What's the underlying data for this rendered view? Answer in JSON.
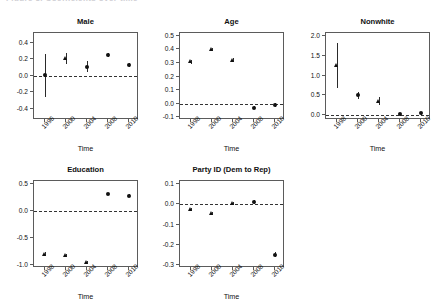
{
  "figure": {
    "clipped_header_text": "Figure 3. Coefficients over time",
    "background_color": "#ffffff",
    "marker_color": "#111111",
    "axis_color": "#5b5b5b",
    "zero_line_color": "#333333"
  },
  "chart_data": [
    {
      "type": "scatter",
      "title": "Male",
      "xlabel": "Time",
      "ylabel": "",
      "grid": false,
      "legend": "none",
      "zero_reference_line": 0.0,
      "x": [
        1996,
        2000,
        2004,
        2008,
        2010
      ],
      "xticklabels": [
        "1996",
        "2000",
        "2004",
        "2008",
        "2010"
      ],
      "values": [
        0.01,
        0.21,
        0.11,
        0.25,
        0.13
      ],
      "ci_low": [
        -0.26,
        0.14,
        0.05,
        0.225,
        0.1
      ],
      "ci_high": [
        0.27,
        0.28,
        0.18,
        0.275,
        0.16
      ],
      "marker_shapes": [
        "dot",
        "tri",
        "dot",
        "dot",
        "dot"
      ],
      "ylim": [
        -0.54,
        0.52
      ],
      "yticks": [
        0.4,
        0.2,
        0.0,
        -0.2,
        -0.4
      ],
      "yticklabels": [
        "0.4",
        "0.2",
        "0.0",
        "-0.2",
        "-0.4"
      ]
    },
    {
      "type": "scatter",
      "title": "Age",
      "xlabel": "Time",
      "ylabel": "",
      "grid": false,
      "legend": "none",
      "zero_reference_line": 0.0,
      "x": [
        1998,
        2000,
        2004,
        2008,
        2010
      ],
      "xticklabels": [
        "1998",
        "2000",
        "2004",
        "2008",
        "2010"
      ],
      "values": [
        0.31,
        0.4,
        0.32,
        -0.03,
        -0.01
      ],
      "ci_low": [
        0.295,
        0.39,
        0.305,
        -0.042,
        -0.022
      ],
      "ci_high": [
        0.325,
        0.41,
        0.335,
        -0.018,
        0.002
      ],
      "marker_shapes": [
        "tri",
        "tri",
        "tri",
        "dot",
        "dot"
      ],
      "ylim": [
        -0.12,
        0.52
      ],
      "yticks": [
        0.5,
        0.4,
        0.3,
        0.2,
        0.1,
        0.0,
        -0.1
      ],
      "yticklabels": [
        "0.5",
        "0.4",
        "0.3",
        "0.2",
        "0.1",
        "0.0",
        "-0.1"
      ]
    },
    {
      "type": "scatter",
      "title": "Nonwhite",
      "xlabel": "Time",
      "ylabel": "",
      "grid": false,
      "legend": "none",
      "zero_reference_line": 0.0,
      "x": [
        1998,
        2000,
        2004,
        2008,
        2010
      ],
      "xticklabels": [
        "1998",
        "2000",
        "2004",
        "2008",
        "2010"
      ],
      "values": [
        1.27,
        0.5,
        0.36,
        0.02,
        0.05
      ],
      "ci_low": [
        0.7,
        0.42,
        0.27,
        -0.01,
        0.01
      ],
      "ci_high": [
        1.83,
        0.58,
        0.45,
        0.05,
        0.09
      ],
      "marker_shapes": [
        "tri",
        "dot",
        "tri",
        "dot",
        "dot"
      ],
      "ylim": [
        -0.12,
        2.08
      ],
      "yticks": [
        2.0,
        1.5,
        1.0,
        0.5,
        0.0
      ],
      "yticklabels": [
        "2.0",
        "1.5",
        "1.0",
        "0.5",
        "0.0"
      ]
    },
    {
      "type": "scatter",
      "title": "Education",
      "xlabel": "Time",
      "ylabel": "",
      "grid": false,
      "legend": "none",
      "zero_reference_line": 0.0,
      "x": [
        1998,
        2000,
        2004,
        2008,
        2010
      ],
      "xticklabels": [
        "1998",
        "2000",
        "2004",
        "2008",
        "2010"
      ],
      "values": [
        -0.8,
        -0.82,
        -0.96,
        0.32,
        0.29
      ],
      "ci_low": [
        -0.83,
        -0.85,
        -0.99,
        0.3,
        0.27
      ],
      "ci_high": [
        -0.77,
        -0.79,
        -0.93,
        0.34,
        0.31
      ],
      "marker_shapes": [
        "tri",
        "tri",
        "tri",
        "dot",
        "dot"
      ],
      "ylim": [
        -1.06,
        0.56
      ],
      "yticks": [
        0.5,
        0.0,
        -0.5,
        -1.0
      ],
      "yticklabels": [
        "0.5",
        "0.0",
        "-0.5",
        "-1.0"
      ]
    },
    {
      "type": "scatter",
      "title": "Party ID (Dem to Rep)",
      "xlabel": "Time",
      "ylabel": "",
      "grid": false,
      "legend": "none",
      "zero_reference_line": 0.0,
      "x": [
        1998,
        2000,
        2004,
        2008,
        2010
      ],
      "xticklabels": [
        "1998",
        "2000",
        "2004",
        "2008",
        "2010"
      ],
      "values": [
        -0.025,
        -0.045,
        0.005,
        0.01,
        -0.25
      ],
      "ci_low": [
        -0.032,
        -0.052,
        -0.002,
        0.0,
        -0.262
      ],
      "ci_high": [
        -0.018,
        -0.038,
        0.012,
        0.02,
        -0.238
      ],
      "marker_shapes": [
        "tri",
        "tri",
        "tri",
        "dot",
        "dot"
      ],
      "ylim": [
        -0.315,
        0.115
      ],
      "yticks": [
        0.1,
        0.0,
        -0.1,
        -0.2,
        -0.3
      ],
      "yticklabels": [
        "0.1",
        "0.0",
        "-0.1",
        "-0.2",
        "-0.3"
      ]
    }
  ]
}
